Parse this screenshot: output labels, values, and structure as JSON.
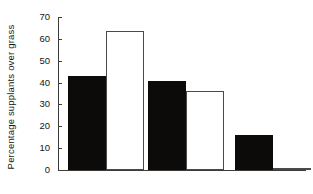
{
  "chart_data": {
    "type": "bar",
    "title": "",
    "subtitle": "",
    "xlabel": "",
    "ylabel": "Percentage supplants over grass",
    "categories": [
      "Close rank",
      "Mid rank",
      "Distant rank"
    ],
    "series": [
      {
        "name": "filled",
        "style": "solid-black",
        "color": "#0d0b09",
        "values": [
          43,
          40.5,
          16
        ]
      },
      {
        "name": "open",
        "style": "open-outline",
        "color": "#ffffff",
        "values": [
          63.5,
          36,
          1
        ]
      }
    ],
    "ylim": [
      0,
      70
    ],
    "ytick_labels": [
      "0",
      "10",
      "20",
      "30",
      "40",
      "50",
      "60",
      "70"
    ],
    "ytick_values": [
      0,
      10,
      20,
      30,
      40,
      50,
      60,
      70
    ],
    "ytick_step": 10,
    "grid": false,
    "legend": false,
    "legend_position": "none",
    "annotations": []
  },
  "axis": {
    "y_title": "Percentage supplants over grass",
    "axis_color": "#3b3b3b"
  }
}
